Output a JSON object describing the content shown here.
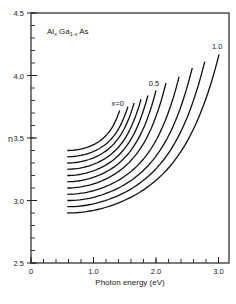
{
  "chart_data": {
    "type": "line",
    "title": "",
    "annotation": {
      "main": "Al",
      "sub1": "x",
      "mid": " Ga",
      "sub2": "1-x",
      "end": " As"
    },
    "xlabel": "Photon energy (eV)",
    "ylabel": "n",
    "xlim": [
      0,
      3.15
    ],
    "ylim": [
      2.5,
      4.5
    ],
    "x_ticks": [
      {
        "v": 0,
        "label": "0"
      },
      {
        "v": 1.0,
        "label": "1.0"
      },
      {
        "v": 2.0,
        "label": "2.0"
      },
      {
        "v": 3.0,
        "label": "3.0"
      }
    ],
    "x_minor_step": 0.2,
    "y_ticks": [
      {
        "v": 2.5,
        "label": "2.5"
      },
      {
        "v": 3.0,
        "label": "3.0"
      },
      {
        "v": 3.5,
        "label": "3.5"
      },
      {
        "v": 4.0,
        "label": "4.0"
      },
      {
        "v": 4.5,
        "label": "4.5"
      }
    ],
    "y_minor_step": 0.1,
    "grid": false,
    "legend": "inline curve labels",
    "curve_labels": [
      {
        "series": "x=0",
        "text": "x=0"
      },
      {
        "series": "x=0.5",
        "text": "0.5"
      },
      {
        "series": "x=1.0",
        "text": "1.0"
      }
    ],
    "series": [
      {
        "name": "x=0",
        "x_start": 0.58,
        "n_start": 3.4,
        "x_end": 1.42,
        "n_end": 3.72
      },
      {
        "name": "x=0.1",
        "x_start": 0.58,
        "n_start": 3.35,
        "x_end": 1.55,
        "n_end": 3.75
      },
      {
        "name": "x=0.2",
        "x_start": 0.58,
        "n_start": 3.3,
        "x_end": 1.65,
        "n_end": 3.78
      },
      {
        "name": "x=0.3",
        "x_start": 0.58,
        "n_start": 3.25,
        "x_end": 1.76,
        "n_end": 3.81
      },
      {
        "name": "x=0.4",
        "x_start": 0.58,
        "n_start": 3.2,
        "x_end": 1.87,
        "n_end": 3.84
      },
      {
        "name": "x=0.5",
        "x_start": 0.58,
        "n_start": 3.15,
        "x_end": 2.0,
        "n_end": 3.88
      },
      {
        "name": "x=0.6",
        "x_start": 0.58,
        "n_start": 3.1,
        "x_end": 2.16,
        "n_end": 3.94
      },
      {
        "name": "x=0.7",
        "x_start": 0.58,
        "n_start": 3.05,
        "x_end": 2.37,
        "n_end": 3.99
      },
      {
        "name": "x=0.8",
        "x_start": 0.58,
        "n_start": 3.0,
        "x_end": 2.58,
        "n_end": 4.06
      },
      {
        "name": "x=0.9",
        "x_start": 0.58,
        "n_start": 2.95,
        "x_end": 2.78,
        "n_end": 4.11
      },
      {
        "name": "x=1.0",
        "x_start": 0.58,
        "n_start": 2.9,
        "x_end": 3.01,
        "n_end": 4.17
      }
    ]
  }
}
